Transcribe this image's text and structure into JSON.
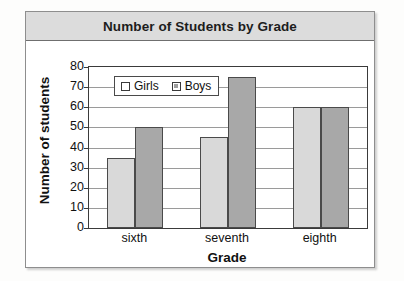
{
  "chart": {
    "title": "Number of Students by Grade"
  },
  "chart_data": {
    "type": "bar",
    "title": "Number of Students by Grade",
    "xlabel": "Grade",
    "ylabel": "Number of students",
    "categories": [
      "sixth",
      "seventh",
      "eighth"
    ],
    "series": [
      {
        "name": "Girls",
        "values": [
          35,
          45,
          60
        ],
        "color": "#d9d9d9"
      },
      {
        "name": "Boys",
        "values": [
          50,
          75,
          60
        ],
        "color": "#a8a8a8"
      }
    ],
    "ylim": [
      0,
      80
    ],
    "ytick_labels": [
      "80",
      "70",
      "60",
      "50",
      "40",
      "30",
      "20",
      "10",
      "0"
    ],
    "ytick_values": [
      80,
      70,
      60,
      50,
      40,
      30,
      20,
      10,
      0
    ],
    "ystep": 10,
    "grid": true,
    "legend_position": "top-left-inside",
    "bar_outline_color": "#4a4a4a"
  }
}
